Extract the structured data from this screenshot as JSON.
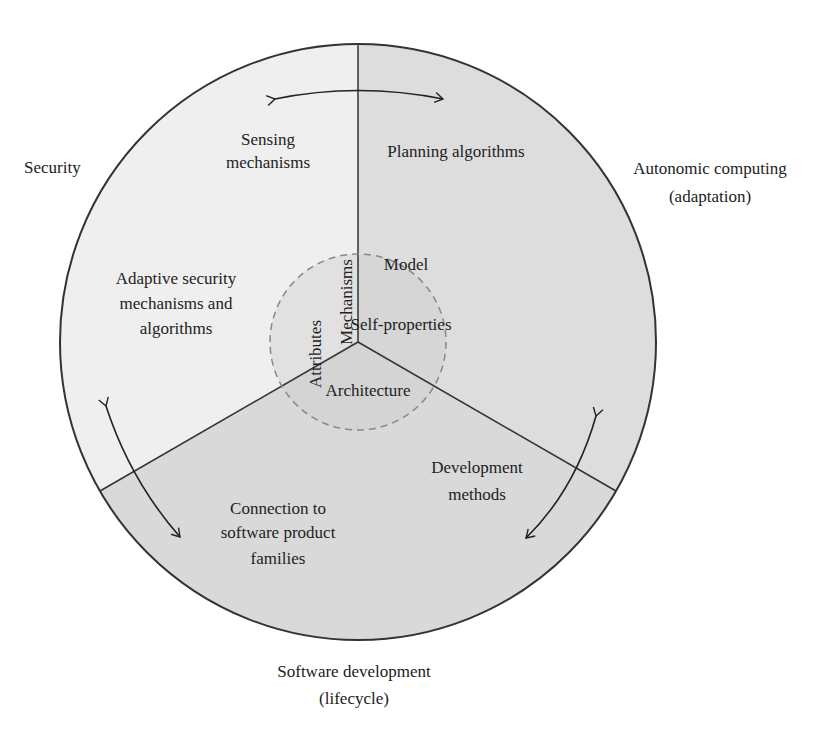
{
  "diagram": {
    "type": "circular-sector-diagram",
    "colors": {
      "background": "#ffffff",
      "security_sector": "#efefef",
      "autonomic_sector": "#dcdcdc",
      "software_sector": "#d8d8d8",
      "inner_circle": "#cfcfcf",
      "outline": "#333333",
      "dashed_outline": "#888888"
    },
    "outer_labels": {
      "security": "Security",
      "autonomic_line1": "Autonomic computing",
      "autonomic_line2": "(adaptation)",
      "software_line1": "Software development",
      "software_line2": "(lifecycle)"
    },
    "sectors": {
      "security": {
        "top_line1": "Sensing",
        "top_line2": "mechanisms",
        "mid_line1": "Adaptive security",
        "mid_line2": "mechanisms and",
        "mid_line3": "algorithms"
      },
      "autonomic": {
        "top": "Planning algorithms"
      },
      "software": {
        "left_line1": "Connection to",
        "left_line2": "software product",
        "left_line3": "families",
        "right_line1": "Development",
        "right_line2": "methods"
      }
    },
    "inner_circle": {
      "attributes": "Attributes",
      "mechanisms": "Mechanisms",
      "model": "Model",
      "self_properties": "Self-properties",
      "architecture": "Architecture"
    },
    "arrows": [
      {
        "name": "security-autonomic-arrow",
        "bidirectional": true
      },
      {
        "name": "security-software-arrow",
        "bidirectional": true
      },
      {
        "name": "autonomic-software-arrow",
        "bidirectional": true
      }
    ]
  }
}
